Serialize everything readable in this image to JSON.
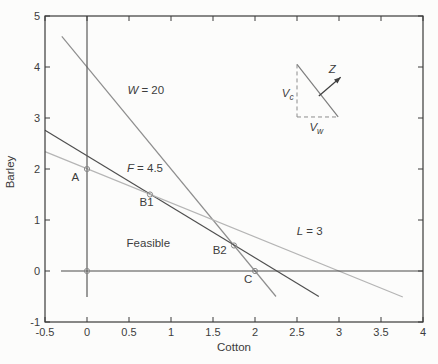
{
  "figure": {
    "background": "#fcfcfb",
    "axis_color": "#3a3a3a",
    "text_color": "#3d3d3d"
  },
  "chart_data": {
    "type": "line",
    "title": "",
    "xlabel": "Cotton",
    "ylabel": "Barley",
    "xlim": [
      -0.5,
      4
    ],
    "ylim": [
      -1,
      5
    ],
    "grid": false,
    "legend": "none",
    "xticks": [
      -0.5,
      0,
      0.5,
      1,
      1.5,
      2,
      2.5,
      3,
      3.5,
      4
    ],
    "xtick_labels": [
      "-0.5",
      "0",
      "0.5",
      "1",
      "1.5",
      "2",
      "2.5",
      "3",
      "3.5",
      "4"
    ],
    "yticks": [
      -1,
      0,
      1,
      2,
      3,
      4,
      5
    ],
    "ytick_labels": [
      "-1",
      "0",
      "1",
      "2",
      "3",
      "4",
      "5"
    ],
    "series": [
      {
        "name": "water-constraint-line",
        "label": "W = 20",
        "color": "#8e8e8e",
        "points": [
          [
            -0.3,
            4.6
          ],
          [
            2.25,
            -0.5
          ]
        ]
      },
      {
        "name": "fertilizer-constraint-line",
        "label": "F = 4.5",
        "color": "#4f4f4f",
        "points": [
          [
            -0.5,
            2.76
          ],
          [
            2.76,
            -0.5
          ]
        ]
      },
      {
        "name": "land-constraint-line",
        "label": "L = 3",
        "color": "#b5b5b5",
        "points": [
          [
            -0.5,
            2.34
          ],
          [
            3.76,
            -0.51
          ]
        ]
      },
      {
        "name": "zero-horizontal-line",
        "label": "",
        "color": "#4a4a4a",
        "points": [
          [
            -0.31,
            0
          ],
          [
            4,
            0
          ]
        ]
      },
      {
        "name": "zero-vertical-line",
        "label": "",
        "color": "#5a5a5a",
        "points": [
          [
            0,
            -0.51
          ],
          [
            0,
            5
          ]
        ]
      }
    ],
    "markers": {
      "style": "open-circle",
      "radius": 2.6,
      "color": "#878787",
      "points": [
        {
          "name": "point-A",
          "x": 0,
          "y": 2
        },
        {
          "name": "point-B1",
          "x": 0.75,
          "y": 1.5
        },
        {
          "name": "point-B2",
          "x": 1.75,
          "y": 0.5
        },
        {
          "name": "point-C",
          "x": 2,
          "y": 0
        },
        {
          "name": "point-origin",
          "x": 0,
          "y": 0
        }
      ]
    },
    "annotations": [
      {
        "name": "label-w-constraint",
        "x": 0.7,
        "y": 3.55,
        "parts": [
          {
            "t": "W",
            "style": "italic"
          },
          {
            "t": " = 20"
          }
        ]
      },
      {
        "name": "label-f-constraint",
        "x": 0.69,
        "y": 2.01,
        "parts": [
          {
            "t": "F",
            "style": "italic"
          },
          {
            "t": " = 4.5"
          }
        ]
      },
      {
        "name": "label-l-constraint",
        "x": 2.65,
        "y": 0.79,
        "parts": [
          {
            "t": "L",
            "style": "italic"
          },
          {
            "t": " = 3"
          }
        ]
      },
      {
        "name": "label-point-A",
        "x": -0.14,
        "y": 1.85,
        "parts": [
          {
            "t": "A"
          }
        ]
      },
      {
        "name": "label-point-B1",
        "x": 0.71,
        "y": 1.35,
        "parts": [
          {
            "t": "B1"
          }
        ]
      },
      {
        "name": "label-point-B2",
        "x": 1.58,
        "y": 0.42,
        "parts": [
          {
            "t": "B2"
          }
        ]
      },
      {
        "name": "label-point-C",
        "x": 1.92,
        "y": -0.15,
        "parts": [
          {
            "t": "C"
          }
        ]
      },
      {
        "name": "label-feasible-region",
        "x": 0.73,
        "y": 0.54,
        "parts": [
          {
            "t": "Feasible"
          }
        ]
      }
    ],
    "inset": {
      "solid_line": {
        "color": "#7e7e7e",
        "from": [
          2.5,
          4.05
        ],
        "to": [
          2.99,
          3.02
        ]
      },
      "dashed_vertical_line": {
        "color": "#8c8c8c",
        "from": [
          2.5,
          4.05
        ],
        "to": [
          2.5,
          3.02
        ]
      },
      "dashed_horizontal_line": {
        "color": "#8c8c8c",
        "from": [
          2.5,
          3.02
        ],
        "to": [
          2.99,
          3.02
        ]
      },
      "arrow": {
        "color": "#3f3f3f",
        "from": [
          2.76,
          3.43
        ],
        "to": [
          3.02,
          3.8
        ]
      },
      "labels": [
        {
          "name": "label-z-vector",
          "x": 2.92,
          "y": 3.97,
          "parts": [
            {
              "t": "Z",
              "style": "italic"
            }
          ]
        },
        {
          "name": "label-vc-vector",
          "x": 2.39,
          "y": 3.49,
          "parts": [
            {
              "t": "V",
              "style": "italic"
            },
            {
              "t": "c",
              "style": "italic",
              "sub": true
            }
          ]
        },
        {
          "name": "label-vw-vector",
          "x": 2.73,
          "y": 2.82,
          "parts": [
            {
              "t": "V",
              "style": "italic"
            },
            {
              "t": "w",
              "style": "italic",
              "sub": true
            }
          ]
        }
      ]
    }
  }
}
